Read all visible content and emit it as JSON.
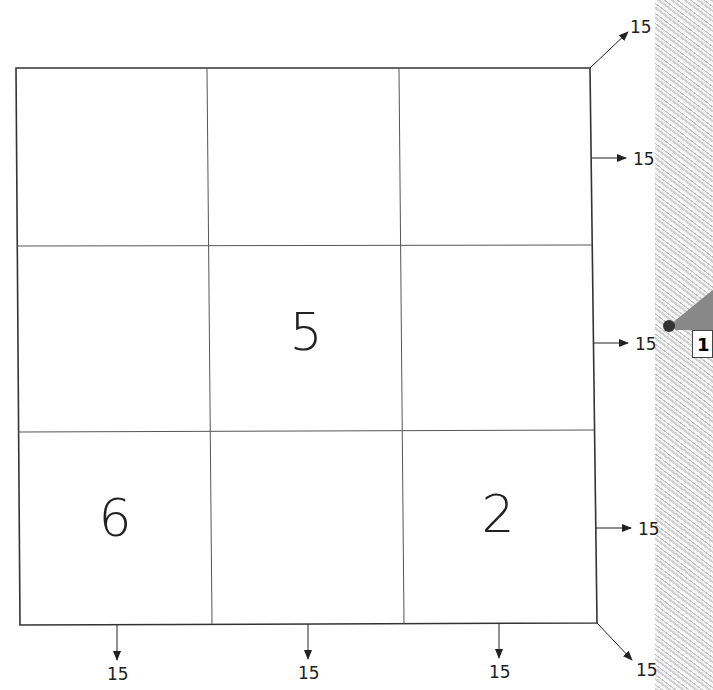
{
  "puzzle": {
    "type": "magic-square",
    "magic_sum": "15",
    "grid": [
      [
        "",
        "",
        ""
      ],
      [
        "",
        "5",
        ""
      ],
      [
        "6",
        "",
        "2"
      ]
    ],
    "row_sums": [
      "15",
      "15",
      "15"
    ],
    "column_sums": [
      "15",
      "15",
      "15"
    ],
    "diagonal_sums": {
      "anti_diagonal_top_right": "15",
      "main_diagonal_bottom_right": "15"
    }
  },
  "side_figure": {
    "tag_text": "1"
  }
}
